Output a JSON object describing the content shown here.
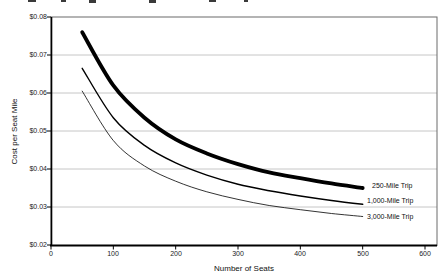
{
  "chart_data": {
    "type": "line",
    "title": "",
    "xlabel": "Number of Seats",
    "ylabel": "Cost per Seat Mile",
    "xlim": [
      0,
      620
    ],
    "ylim": [
      0.02,
      0.08
    ],
    "x_ticks": [
      0,
      100,
      200,
      300,
      400,
      500,
      600
    ],
    "x_tick_labels": [
      "0",
      "100",
      "200",
      "300",
      "400",
      "500",
      "600"
    ],
    "y_ticks": [
      0.02,
      0.03,
      0.04,
      0.05,
      0.06,
      0.07,
      0.08
    ],
    "y_tick_labels": [
      "$0.02",
      "$0.03",
      "$0.04",
      "$0.05",
      "$0.06",
      "$0.07",
      "$0.08"
    ],
    "grid": "horizontal-gridlines-on",
    "legend_position": "labels-at-line-ends-right",
    "series": [
      {
        "name": "250-Mile Trip",
        "weight": "thick",
        "x": [
          50,
          100,
          150,
          200,
          250,
          300,
          350,
          400,
          450,
          500
        ],
        "y": [
          0.076,
          0.062,
          0.0535,
          0.0478,
          0.0441,
          0.0413,
          0.0391,
          0.0376,
          0.0362,
          0.035
        ]
      },
      {
        "name": "1,000-Mile Trip",
        "weight": "medium",
        "x": [
          50,
          100,
          150,
          200,
          250,
          300,
          350,
          400,
          450,
          500
        ],
        "y": [
          0.0665,
          0.0535,
          0.0462,
          0.0416,
          0.0384,
          0.036,
          0.0343,
          0.0329,
          0.0317,
          0.0307
        ]
      },
      {
        "name": "3,000-Mile Trip",
        "weight": "thin",
        "x": [
          50,
          100,
          150,
          200,
          250,
          300,
          350,
          400,
          450,
          500
        ],
        "y": [
          0.0605,
          0.0475,
          0.0408,
          0.0368,
          0.034,
          0.032,
          0.0304,
          0.0293,
          0.0283,
          0.0275
        ]
      }
    ]
  },
  "colors": {
    "line": "#000000",
    "grid": "#c6c6c6",
    "border": "#6b6b6b",
    "axis": "#000000",
    "text": "#1a1a1a",
    "background": "#ffffff"
  }
}
